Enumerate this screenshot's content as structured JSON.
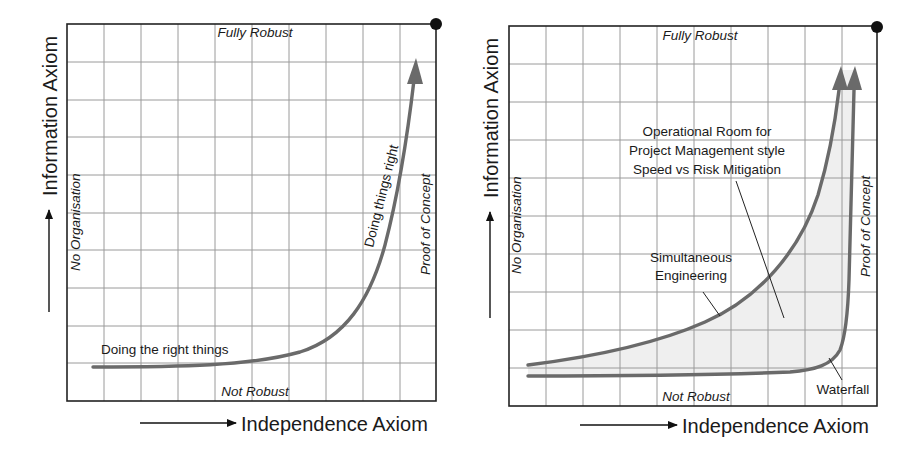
{
  "colors": {
    "curve": "#6a6a6a",
    "grid": "#9a9a9a",
    "frame": "#222222",
    "shaded_area": "#efefef"
  },
  "left_diagram": {
    "y_axis_title": "Information Axiom",
    "x_axis_title": "Independence Axiom",
    "top_label": "Fully Robust",
    "bottom_label": "Not Robust",
    "left_label": "No Organisation",
    "right_label": "Proof of Concept",
    "curve_label_low": "Doing the right things",
    "curve_label_high": "Doing things right"
  },
  "right_diagram": {
    "y_axis_title": "Information Axiom",
    "x_axis_title": "Independence Axiom",
    "top_label": "Fully Robust",
    "bottom_label": "Not Robust",
    "left_label": "No Organisation",
    "right_label": "Proof of Concept",
    "operational_room": {
      "line1": "Operational Room for",
      "line2": "Project Management style",
      "line3": "Speed vs Risk Mitigation"
    },
    "simultaneous": {
      "line1": "Simultaneous",
      "line2": "Engineering"
    },
    "waterfall": "Waterfall"
  }
}
